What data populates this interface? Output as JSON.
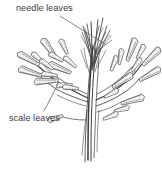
{
  "figure": {
    "type": "botanical-line-illustration",
    "background_color": "#ffffff",
    "ink_color": "#3c3c3c"
  },
  "labels": {
    "needle_leaves": "needle leaves",
    "scale_leaves": "scale leaves"
  },
  "leader_lines": [
    {
      "name": "needle-leaves-leader",
      "from_label": "needle leaves",
      "points": "60,16 105,44"
    },
    {
      "name": "scale-leaves-leader",
      "from_label": "scale leaves",
      "points": "44,111 58,84"
    }
  ],
  "parts": {
    "main_stem": "central vertical stem",
    "needle_cluster": "upright cluster of fine needle leaves at apex",
    "left_branch": "lateral spray of scale leaves on left",
    "right_branch": "lateral spray of scale leaves on right"
  }
}
